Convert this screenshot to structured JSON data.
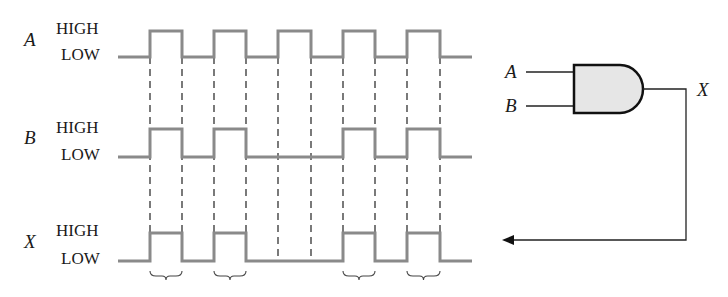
{
  "diagram": {
    "type": "timing-diagram-with-and-gate",
    "signals": [
      {
        "name": "A",
        "high_label": "HIGH",
        "low_label": "LOW",
        "pulses": [
          [
            150,
            182
          ],
          [
            214,
            246
          ],
          [
            278,
            311
          ],
          [
            343,
            375
          ],
          [
            407,
            440
          ]
        ]
      },
      {
        "name": "B",
        "high_label": "HIGH",
        "low_label": "LOW",
        "pulses": [
          [
            150,
            182
          ],
          [
            214,
            246
          ],
          [
            343,
            375
          ],
          [
            407,
            440
          ]
        ]
      },
      {
        "name": "X",
        "high_label": "HIGH",
        "low_label": "LOW",
        "pulses": [
          [
            150,
            182
          ],
          [
            214,
            246
          ],
          [
            343,
            375
          ],
          [
            407,
            440
          ]
        ]
      }
    ],
    "gate": {
      "type": "AND",
      "inputs": [
        "A",
        "B"
      ],
      "output": "X",
      "fill": "#e6e6e6"
    },
    "dashed_guides_x": [
      150,
      182,
      214,
      246,
      278,
      311,
      343,
      375,
      407,
      440
    ],
    "braces_under_x_pulses": 4,
    "colors": {
      "waveform": "#8a8a8a",
      "lines": "#222222",
      "gate_fill": "#e6e6e6"
    }
  }
}
